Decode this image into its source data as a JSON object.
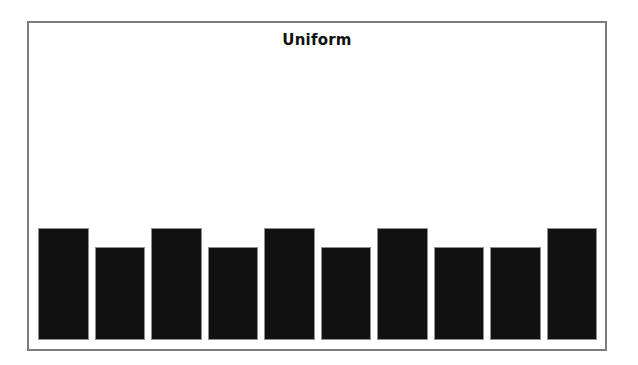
{
  "page": {
    "background": "#ffffff"
  },
  "figure": {
    "frame_color": "#7c7c7c",
    "background": "#ffffff",
    "title_color": "#111111"
  },
  "chart_data": {
    "type": "bar",
    "title": "Uniform",
    "values": [
      1,
      0.83,
      1,
      0.83,
      1,
      0.83,
      1,
      0.83,
      0.83,
      1
    ],
    "values_relative": true,
    "n_bars": 10,
    "xlabel": "",
    "ylabel": "",
    "x_tick_labels": [],
    "y_tick_labels": [],
    "axes_visible": false,
    "grid": false,
    "legend": "none",
    "bar_color": "#111111",
    "bar_edge_color": "#8f8f8f"
  }
}
